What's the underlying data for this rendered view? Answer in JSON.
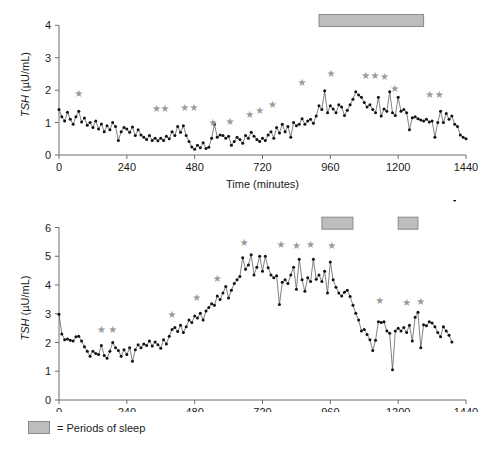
{
  "figure": {
    "legend": {
      "swatch_name": "sleep-period-swatch",
      "text": "= Periods of sleep",
      "color": "#bdbdbd"
    }
  },
  "chart_data": [
    {
      "id": "top",
      "type": "line",
      "title": "",
      "xlabel": "Time (minutes)",
      "ylabel": "TSH (µU/mL)",
      "ylabel_italic_part": "TSH",
      "ylabel_rest": " (µU/mL)",
      "xlim": [
        0,
        1440
      ],
      "ylim": [
        0,
        4.35
      ],
      "xticks": [
        0,
        240,
        480,
        720,
        960,
        1200,
        1440
      ],
      "xticklabels": [
        "0",
        "240",
        "480",
        "720",
        "960",
        "1200",
        "1440"
      ],
      "yticks": [
        0,
        1,
        2,
        3,
        4
      ],
      "yticklabels": [
        "0",
        "1",
        "2",
        "3",
        "4"
      ],
      "grid": false,
      "legend_position": "below-figure",
      "marker": "filled-circle",
      "line_color": "#4a4a4a",
      "marker_color": "#111111",
      "sleep_periods": [
        [
          920,
          1290
        ]
      ],
      "sleep_bar_y": 4.15,
      "pulse_markers": [
        {
          "x": 70,
          "y": 1.78
        },
        {
          "x": 345,
          "y": 1.33
        },
        {
          "x": 375,
          "y": 1.33
        },
        {
          "x": 445,
          "y": 1.35
        },
        {
          "x": 478,
          "y": 1.35
        },
        {
          "x": 545,
          "y": 0.88
        },
        {
          "x": 605,
          "y": 0.92
        },
        {
          "x": 675,
          "y": 1.15
        },
        {
          "x": 710,
          "y": 1.28
        },
        {
          "x": 755,
          "y": 1.45
        },
        {
          "x": 860,
          "y": 2.13
        },
        {
          "x": 962,
          "y": 2.4
        },
        {
          "x": 1085,
          "y": 2.34
        },
        {
          "x": 1118,
          "y": 2.36
        },
        {
          "x": 1152,
          "y": 2.3
        },
        {
          "x": 1188,
          "y": 1.95
        },
        {
          "x": 1312,
          "y": 1.75
        },
        {
          "x": 1345,
          "y": 1.75
        }
      ],
      "x": [
        0,
        10,
        20,
        30,
        40,
        50,
        60,
        70,
        80,
        90,
        100,
        110,
        120,
        130,
        140,
        150,
        160,
        170,
        180,
        190,
        200,
        210,
        220,
        230,
        240,
        250,
        260,
        270,
        280,
        290,
        300,
        310,
        320,
        330,
        340,
        350,
        360,
        370,
        380,
        390,
        400,
        410,
        420,
        430,
        440,
        450,
        460,
        470,
        480,
        490,
        500,
        510,
        520,
        530,
        540,
        550,
        560,
        570,
        580,
        590,
        600,
        610,
        620,
        630,
        640,
        650,
        660,
        670,
        680,
        690,
        700,
        710,
        720,
        730,
        740,
        750,
        760,
        770,
        780,
        790,
        800,
        810,
        820,
        830,
        840,
        850,
        860,
        870,
        880,
        890,
        900,
        910,
        920,
        930,
        940,
        950,
        960,
        970,
        980,
        990,
        1000,
        1010,
        1020,
        1030,
        1040,
        1050,
        1060,
        1070,
        1080,
        1090,
        1100,
        1110,
        1120,
        1130,
        1140,
        1150,
        1160,
        1170,
        1180,
        1190,
        1200,
        1210,
        1220,
        1230,
        1240,
        1250,
        1260,
        1270,
        1280,
        1290,
        1300,
        1310,
        1320,
        1330,
        1340,
        1350,
        1360,
        1370,
        1380,
        1390,
        1400,
        1410,
        1420,
        1430,
        1440
      ],
      "y": [
        1.4,
        1.18,
        1.05,
        1.32,
        1.1,
        0.95,
        1.18,
        1.35,
        1.02,
        1.14,
        0.92,
        1.0,
        0.85,
        1.05,
        0.8,
        0.96,
        0.72,
        0.9,
        0.78,
        1.0,
        0.88,
        0.45,
        0.72,
        0.85,
        0.8,
        0.7,
        0.86,
        0.6,
        0.78,
        0.62,
        0.55,
        0.48,
        0.6,
        0.45,
        0.52,
        0.44,
        0.52,
        0.45,
        0.58,
        0.5,
        0.72,
        0.6,
        0.88,
        0.7,
        0.9,
        0.6,
        0.42,
        0.25,
        0.18,
        0.3,
        0.22,
        0.38,
        0.2,
        0.24,
        0.52,
        0.95,
        0.55,
        0.62,
        0.6,
        0.52,
        0.58,
        0.3,
        0.42,
        0.55,
        0.48,
        0.36,
        0.6,
        0.52,
        0.7,
        0.58,
        0.48,
        0.42,
        0.52,
        0.45,
        0.62,
        0.72,
        0.52,
        0.85,
        0.68,
        0.95,
        0.72,
        0.88,
        0.55,
        1.0,
        0.9,
        0.95,
        1.12,
        0.95,
        1.05,
        1.1,
        0.98,
        1.2,
        1.52,
        1.4,
        1.98,
        1.3,
        1.52,
        1.42,
        1.3,
        1.55,
        1.48,
        1.22,
        1.38,
        1.55,
        1.72,
        1.95,
        1.85,
        1.78,
        1.62,
        1.48,
        1.55,
        1.4,
        1.3,
        1.78,
        1.2,
        1.42,
        1.35,
        1.95,
        1.3,
        1.22,
        1.78,
        1.35,
        1.4,
        1.3,
        0.78,
        1.15,
        1.18,
        1.12,
        1.08,
        1.05,
        1.1,
        1.02,
        1.05,
        0.55,
        1.0,
        1.35,
        1.0,
        1.28,
        1.1,
        1.2,
        0.95,
        0.88,
        0.62,
        0.55,
        0.5,
        0.48
      ]
    },
    {
      "id": "bottom",
      "type": "line",
      "title": "",
      "xlabel": "Time (minutes)",
      "ylabel": "TSH (µU/mL)",
      "ylabel_italic_part": "TSH",
      "ylabel_rest": " (µU/mL)",
      "xlim": [
        0,
        1440
      ],
      "ylim": [
        0,
        6.4
      ],
      "xticks": [
        0,
        240,
        480,
        720,
        960,
        1200,
        1440
      ],
      "xticklabels": [
        "0",
        "240",
        "480",
        "720",
        "960",
        "1200",
        "1440"
      ],
      "yticks": [
        0,
        1,
        2,
        3,
        4,
        5,
        6
      ],
      "yticklabels": [
        "0",
        "1",
        "2",
        "3",
        "4",
        "5",
        "6"
      ],
      "grid": false,
      "legend_position": "below-figure",
      "marker": "filled-circle",
      "line_color": "#4a4a4a",
      "marker_color": "#111111",
      "sleep_periods": [
        [
          930,
          1040
        ],
        [
          1200,
          1270
        ]
      ],
      "sleep_bar_y": 6.15,
      "pulse_markers": [
        {
          "x": 150,
          "y": 2.32
        },
        {
          "x": 190,
          "y": 2.34
        },
        {
          "x": 400,
          "y": 2.86
        },
        {
          "x": 487,
          "y": 3.45
        },
        {
          "x": 560,
          "y": 4.12
        },
        {
          "x": 655,
          "y": 5.35
        },
        {
          "x": 785,
          "y": 5.28
        },
        {
          "x": 840,
          "y": 5.26
        },
        {
          "x": 890,
          "y": 5.28
        },
        {
          "x": 965,
          "y": 5.26
        },
        {
          "x": 1135,
          "y": 3.34
        },
        {
          "x": 1230,
          "y": 3.28
        },
        {
          "x": 1280,
          "y": 3.3
        }
      ],
      "x": [
        0,
        10,
        20,
        30,
        40,
        50,
        60,
        70,
        80,
        90,
        100,
        110,
        120,
        130,
        140,
        150,
        160,
        170,
        180,
        190,
        200,
        210,
        220,
        230,
        240,
        250,
        260,
        270,
        280,
        290,
        300,
        310,
        320,
        330,
        340,
        350,
        360,
        370,
        380,
        390,
        400,
        410,
        420,
        430,
        440,
        450,
        460,
        470,
        480,
        490,
        500,
        510,
        520,
        530,
        540,
        550,
        560,
        570,
        580,
        590,
        600,
        610,
        620,
        630,
        640,
        650,
        660,
        670,
        680,
        690,
        700,
        710,
        720,
        730,
        740,
        750,
        760,
        770,
        780,
        790,
        800,
        810,
        820,
        830,
        840,
        850,
        860,
        870,
        880,
        890,
        900,
        910,
        920,
        930,
        940,
        950,
        960,
        970,
        980,
        990,
        1000,
        1010,
        1020,
        1030,
        1040,
        1050,
        1060,
        1070,
        1080,
        1090,
        1100,
        1110,
        1120,
        1130,
        1140,
        1150,
        1160,
        1170,
        1180,
        1190,
        1200,
        1210,
        1220,
        1230,
        1240,
        1250,
        1260,
        1270,
        1280,
        1290,
        1300,
        1310,
        1320,
        1330,
        1340,
        1350,
        1360,
        1370,
        1380,
        1390,
        1400
      ],
      "y": [
        2.98,
        2.3,
        2.1,
        2.12,
        2.08,
        2.05,
        2.2,
        2.22,
        2.05,
        1.85,
        1.7,
        1.52,
        1.7,
        1.62,
        1.58,
        1.9,
        1.55,
        1.45,
        1.7,
        2.0,
        1.82,
        1.72,
        1.52,
        1.75,
        1.58,
        1.82,
        1.35,
        1.75,
        1.92,
        1.82,
        1.95,
        1.9,
        2.05,
        1.88,
        2.02,
        1.92,
        1.8,
        2.1,
        1.95,
        2.22,
        2.45,
        2.52,
        2.38,
        2.6,
        2.35,
        2.55,
        2.78,
        2.7,
        2.92,
        2.85,
        3.02,
        2.78,
        3.1,
        3.22,
        3.35,
        3.3,
        3.62,
        3.5,
        3.72,
        3.95,
        3.55,
        3.82,
        4.05,
        4.18,
        4.3,
        4.95,
        4.55,
        4.7,
        5.05,
        4.35,
        4.62,
        5.0,
        4.48,
        5.0,
        4.6,
        4.35,
        4.25,
        4.32,
        3.32,
        4.1,
        4.18,
        4.05,
        4.35,
        4.62,
        3.85,
        4.9,
        4.18,
        3.78,
        4.25,
        4.12,
        4.9,
        4.2,
        4.35,
        4.12,
        4.48,
        3.72,
        4.8,
        4.18,
        3.92,
        3.72,
        3.62,
        3.75,
        3.82,
        3.6,
        3.3,
        3.02,
        2.78,
        2.4,
        2.45,
        2.28,
        2.1,
        1.72,
        2.08,
        2.72,
        2.7,
        2.72,
        2.4,
        2.32,
        1.05,
        2.4,
        2.5,
        2.4,
        2.52,
        2.35,
        2.6,
        2.05,
        2.88,
        3.05,
        1.82,
        2.62,
        2.58,
        2.72,
        2.68,
        2.55,
        2.35,
        2.2,
        2.55,
        2.4,
        2.25,
        2.02
      ]
    }
  ]
}
